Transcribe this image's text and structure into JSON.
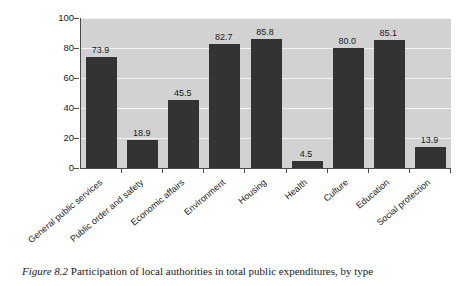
{
  "chart_data": {
    "type": "bar",
    "title": "",
    "xlabel": "",
    "ylabel": "",
    "ylim": [
      0,
      100
    ],
    "ytick_values": [
      100,
      80,
      60,
      40,
      20,
      0
    ],
    "ytick_labels": [
      "100",
      "80",
      "60",
      "40",
      "20",
      "0"
    ],
    "grid": true,
    "legend": "none",
    "categories": [
      "General public services",
      "Public order and safety",
      "Economic affairs",
      "Environment",
      "Housing",
      "Health",
      "Culture",
      "Education",
      "Social protection"
    ],
    "values": [
      73.9,
      18.9,
      45.5,
      82.7,
      85.8,
      4.5,
      80.0,
      85.1,
      13.9
    ],
    "value_labels": [
      "73.9",
      "18.9",
      "45.5",
      "82.7",
      "85.8",
      "4.5",
      "80.0",
      "85.1",
      "13.9"
    ],
    "colors": {
      "bar": "#333333",
      "plot_background": "#d2d2d2",
      "gridline": "#f4f4f4",
      "axis": "#4a4a4a",
      "text": "#1a1a1a",
      "page_background": "#ffffff"
    }
  },
  "caption": {
    "figure_label": "Figure 8.2",
    "text": " Participation of local authorities in total public expenditures, by type"
  }
}
